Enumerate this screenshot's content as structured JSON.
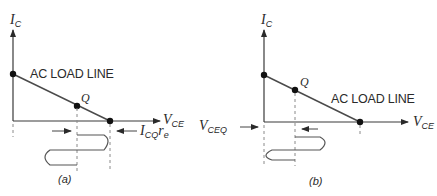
{
  "panels": [
    {
      "id": "a",
      "caption": "(a)",
      "y_axis_label": {
        "main": "I",
        "sub": "C"
      },
      "x_axis_label": {
        "main": "V",
        "sub": "CE"
      },
      "load_line_label": "AC LOAD LINE",
      "q_label": "Q",
      "side_label": {
        "main": "I",
        "sub": "CQ",
        "main2": "r",
        "sub2": "e"
      }
    },
    {
      "id": "b",
      "caption": "(b)",
      "y_axis_label": {
        "main": "I",
        "sub": "C"
      },
      "x_axis_label": {
        "main": "V",
        "sub": "CE"
      },
      "load_line_label": "AC LOAD LINE",
      "q_label": "Q",
      "side_label": {
        "main": "V",
        "sub": "CEQ"
      }
    }
  ],
  "colors": {
    "line": "#3a3a3a",
    "dash": "#8a8a8a",
    "dot": "#111111"
  }
}
